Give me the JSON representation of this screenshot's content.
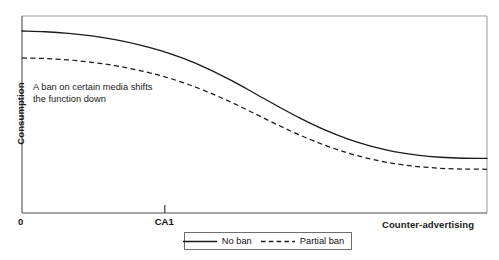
{
  "chart_data": {
    "type": "line",
    "title": "",
    "xlabel": "Counter-advertising",
    "ylabel": "Consumption",
    "xlim": [
      0,
      100
    ],
    "ylim": [
      0,
      100
    ],
    "grid": false,
    "legend_position": "bottom-center",
    "xticks": [
      {
        "value": 0,
        "label": "0"
      },
      {
        "value": 30.7,
        "label": "CA1"
      }
    ],
    "yticks": [],
    "annotations": [
      {
        "text_line1": "A ban on certain media shifts",
        "text_line2": "the function down",
        "x": 2.4,
        "y": 67
      }
    ],
    "series": [
      {
        "name": "No ban",
        "style": "solid",
        "color": "#1a1a1a",
        "x": [
          0,
          5,
          10,
          15,
          20,
          25,
          30,
          35,
          40,
          45,
          50,
          55,
          60,
          65,
          70,
          75,
          80,
          85,
          90,
          95,
          100
        ],
        "y": [
          92.4,
          92.0,
          91.2,
          89.9,
          88.0,
          85.5,
          82.3,
          78.2,
          73.2,
          67.3,
          60.8,
          54.2,
          47.9,
          42.3,
          37.6,
          33.9,
          31.2,
          29.4,
          28.3,
          27.8,
          27.7
        ]
      },
      {
        "name": "Partial ban",
        "style": "dashed",
        "color": "#1a1a1a",
        "x": [
          0,
          5,
          10,
          15,
          20,
          25,
          30,
          35,
          40,
          45,
          50,
          55,
          60,
          65,
          70,
          75,
          80,
          85,
          90,
          95,
          100
        ],
        "y": [
          78.7,
          78.4,
          77.7,
          76.5,
          74.8,
          72.5,
          69.6,
          65.9,
          61.4,
          56.2,
          50.5,
          44.7,
          39.3,
          34.5,
          30.5,
          27.4,
          25.1,
          23.6,
          22.7,
          22.3,
          22.2
        ]
      }
    ]
  },
  "axes": {
    "y_title": "Consumption",
    "x_title": "Counter-advertising",
    "origin_label": "0",
    "ca1_label": "CA1"
  },
  "annotation": {
    "line1": "A ban on certain media shifts",
    "line2": "the function down"
  },
  "legend": {
    "entries": [
      {
        "label": "No ban",
        "style": "solid"
      },
      {
        "label": "Partial ban",
        "style": "dashed"
      }
    ]
  },
  "colors": {
    "curve": "#1a1a1a",
    "frame": "#8c8c8c",
    "axis": "#4d4d4d",
    "text": "#111111",
    "background": "#ffffff"
  }
}
